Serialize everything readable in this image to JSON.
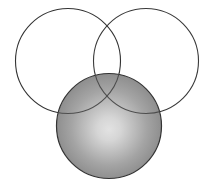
{
  "figure": {
    "title": "Three overlapping circles diagram",
    "canvas": {
      "width": 214,
      "height": 184,
      "background": "#ffffff"
    },
    "stroke": {
      "color": "#333333",
      "width": 1.1,
      "faint_color": "#5a5a5a",
      "faint_width": 1.0
    },
    "gradient": {
      "center_color": "#dedede",
      "mid_color": "#a8a8a8",
      "edge_color": "#838383",
      "highlight_cx": 109,
      "highlight_cy": 130,
      "focal_offset_x": 0,
      "focal_offset_y": 4
    },
    "shapes": [
      {
        "id": "circle-top-left",
        "label": "Top left outline circle",
        "cx": 68,
        "cy": 61,
        "r": 52.5,
        "fill": "none",
        "stroke": "#333333"
      },
      {
        "id": "circle-top-right",
        "label": "Top right outline circle",
        "cx": 146,
        "cy": 61,
        "r": 52.5,
        "fill": "none",
        "stroke": "#333333"
      },
      {
        "id": "circle-bottom-filled",
        "label": "Bottom shaded circle",
        "cx": 109,
        "cy": 126,
        "r": 52.5,
        "fill": "radial-gradient",
        "stroke": "#333333"
      }
    ]
  }
}
